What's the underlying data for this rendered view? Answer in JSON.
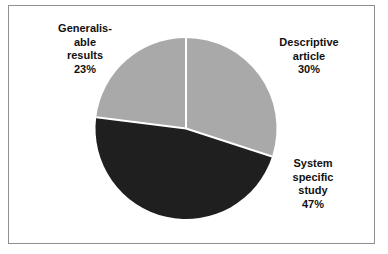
{
  "figure": {
    "background_color": "#ffffff",
    "frame_color": "#8f8f8f",
    "label_color": "#111111"
  },
  "chart_data": {
    "type": "pie",
    "title": "",
    "subtitle": "",
    "xlabel": "",
    "ylabel": "",
    "legend_position": "none",
    "grid": false,
    "start_angle_deg": 0,
    "direction": "clockwise",
    "categories": [
      "Descriptive article",
      "System specific study",
      "Generalisable results"
    ],
    "values": [
      30,
      47,
      23
    ],
    "unit": "%",
    "colors": [
      "#a9a9a9",
      "#1f1f1f",
      "#a9a9a9"
    ],
    "separator_color": "#ffffff",
    "slices": [
      {
        "label": "Descriptive article",
        "label_lines": "Descriptive\narticle\n30%",
        "value": 30,
        "value_text": "30%",
        "color": "#a9a9a9",
        "start_deg": 0,
        "end_deg": 108
      },
      {
        "label": "System specific study",
        "label_lines": "System\nspecific\nstudy\n47%",
        "value": 47,
        "value_text": "47%",
        "color": "#1f1f1f",
        "start_deg": 108,
        "end_deg": 277.2
      },
      {
        "label": "Generalisable results",
        "label_lines": "Generalis-\nable\nresults\n23%",
        "value": 23,
        "value_text": "23%",
        "color": "#a9a9a9",
        "start_deg": 277.2,
        "end_deg": 360
      }
    ]
  }
}
